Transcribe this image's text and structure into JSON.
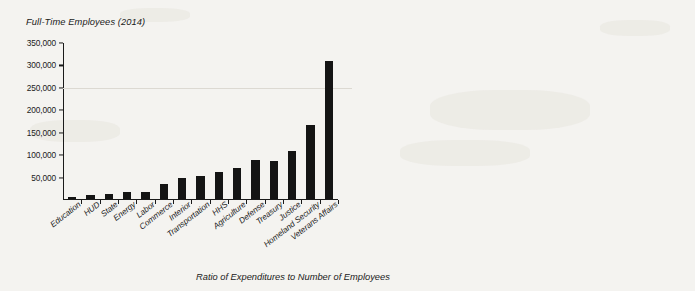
{
  "caption": "Ratio of Expenditures to Number of Employees",
  "colors": {
    "bar": "#141414",
    "axis": "#1a1a1a",
    "background": "#f4f3f0",
    "gridline": "#dcd9d2"
  },
  "chart_data": [
    {
      "type": "bar",
      "title": "Full-Time Employees (2014)",
      "xlabel": "",
      "ylabel": "",
      "ylim": [
        0,
        350000
      ],
      "yticks": [
        "50,000",
        "100,000",
        "150,000",
        "200,000",
        "250,000",
        "300,000",
        "350,000"
      ],
      "ytick_values": [
        50000,
        100000,
        150000,
        200000,
        250000,
        300000,
        350000
      ],
      "grid": false,
      "legend": "none",
      "categories": [
        "Education",
        "HUD",
        "State",
        "Energy",
        "Labor",
        "Commerce",
        "Interior",
        "Transportation",
        "HHS",
        "Agriculture",
        "Defense",
        "Treasury",
        "Justice",
        "Homeland Security",
        "Veterans Affairs"
      ],
      "values": [
        4000,
        8000,
        11000,
        15000,
        16000,
        34000,
        47000,
        51000,
        60000,
        70000,
        87000,
        84000,
        108000,
        165000,
        307000
      ]
    },
    {
      "type": "bar",
      "title": "Expenditures (2014 fiscal year, in millions of dollars)",
      "xlabel": "",
      "ylabel": "",
      "ylim": [
        0,
        1000000
      ],
      "yticks": [
        "0",
        "100,000",
        "200,000",
        "300,000",
        "400,000",
        "500,000",
        "600,000",
        "700,000",
        "800,000",
        "900,000",
        "1,000,000"
      ],
      "ytick_values": [
        0,
        100000,
        200000,
        300000,
        400000,
        500000,
        600000,
        700000,
        800000,
        900000,
        1000000
      ],
      "grid": false,
      "legend": "none",
      "categories": [
        "Education",
        "HUD",
        "State",
        "Energy",
        "Labor",
        "Commerce",
        "Interior",
        "Transportation",
        "HHS",
        "Agriculture",
        "Defense",
        "Treasury",
        "Justice",
        "Homeland Security",
        "Veterans Affairs"
      ],
      "values": [
        58000,
        34000,
        24000,
        19000,
        53000,
        6000,
        11000,
        75000,
        930000,
        140000,
        575000,
        445000,
        27000,
        38000,
        147000
      ]
    }
  ]
}
